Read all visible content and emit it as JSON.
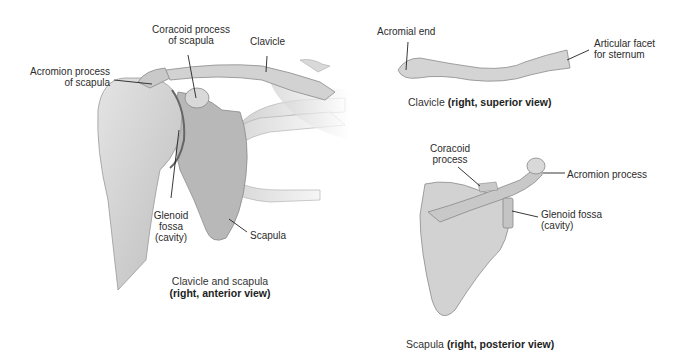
{
  "figure_left": {
    "labels": {
      "coracoid": [
        "Coracoid process",
        "of scapula"
      ],
      "clavicle": "Clavicle",
      "acromion": [
        "Acromion process",
        "of scapula"
      ],
      "glenoid": [
        "Glenoid",
        "fossa",
        "(cavity)"
      ],
      "scapula": "Scapula"
    },
    "caption": {
      "title": "Clavicle and scapula",
      "view": "(right, anterior view)"
    }
  },
  "figure_top_right": {
    "labels": {
      "acromial_end": "Acromial end",
      "articular_facet": [
        "Articular facet",
        "for sternum"
      ]
    },
    "caption": {
      "title": "Clavicle ",
      "view": "(right, superior view)"
    }
  },
  "figure_bottom_right": {
    "labels": {
      "coracoid": [
        "Coracoid",
        "process"
      ],
      "acromion": "Acromion process",
      "glenoid": [
        "Glenoid fossa",
        "(cavity)"
      ]
    },
    "caption": {
      "title": "Scapula ",
      "view": "(right, posterior view)"
    }
  },
  "colors": {
    "bone": "#d6d6d6",
    "bone_dark": "#9a9a9a",
    "outline": "#7a7a7a",
    "leader": "#222222"
  }
}
